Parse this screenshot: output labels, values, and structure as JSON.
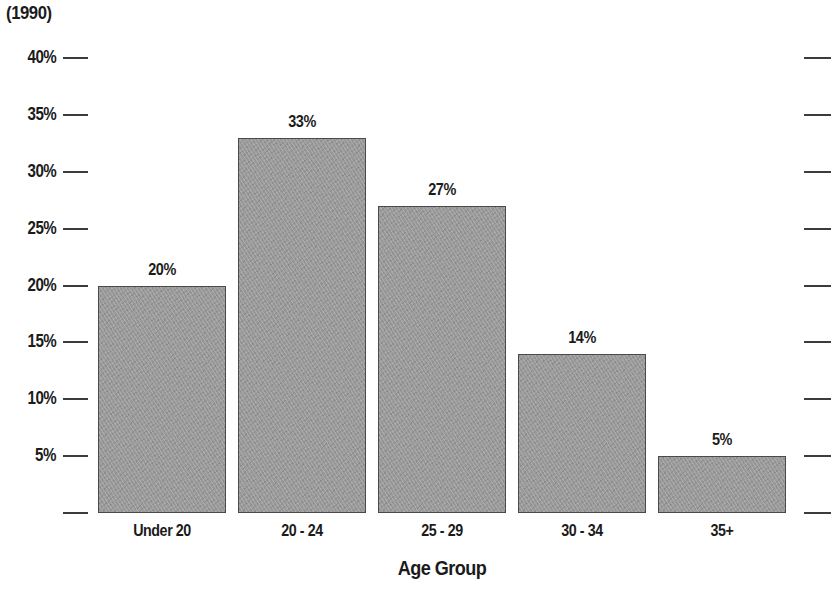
{
  "chart_data": {
    "type": "bar",
    "title": "(1990)",
    "xlabel": "Age Group",
    "ylabel": "",
    "categories": [
      "Under 20",
      "20 - 24",
      "25 - 29",
      "30 - 34",
      "35+"
    ],
    "values": [
      20,
      33,
      27,
      14,
      5
    ],
    "value_labels": [
      "20%",
      "33%",
      "27%",
      "14%",
      "5%"
    ],
    "ylim": [
      0,
      40
    ],
    "ytick_values": [
      40,
      35,
      30,
      25,
      20,
      15,
      10,
      5,
      0
    ],
    "ytick_labels": [
      "40%",
      "35%",
      "30%",
      "25%",
      "20%",
      "15%",
      "10%",
      "5%",
      ""
    ],
    "grid": false,
    "legend": null,
    "bar_fill_color": "#9a9a9a",
    "bar_edge_color": "#4a4a4a",
    "text_color": "#1b1b1b",
    "axis_color": "#3c3c3c",
    "right_axis_ticks": true,
    "background_color": "#ffffff"
  }
}
